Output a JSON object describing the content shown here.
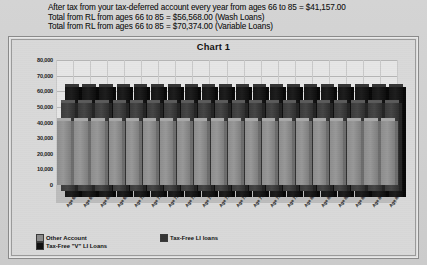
{
  "notes": [
    "After tax from your tax-deferred account every year from ages 66 to 85 = $41,157.00",
    "Total from RL from ages 66 to 85 = $56,568.00 (Wash Loans)",
    "Total from RL from ages 66 to 85 = $70,374.00 (Variable Loans)"
  ],
  "chart": {
    "title": "Chart 1"
  },
  "legend": {
    "items": [
      {
        "label": "Other Account",
        "color": "#8b8b8b"
      },
      {
        "label": "Tax-Free LI loans",
        "color": "#343434"
      },
      {
        "label": "Tax-Free \"V\" LI Loans",
        "color": "#101010"
      }
    ]
  },
  "chart_data": {
    "type": "bar",
    "title": "Chart 1",
    "xlabel": "",
    "ylabel": "",
    "ylim": [
      0,
      80000
    ],
    "yticks": [
      0,
      10000,
      20000,
      30000,
      40000,
      50000,
      60000,
      70000,
      80000
    ],
    "ytick_labels": [
      "0",
      "10,000",
      "20,000",
      "30,000",
      "40,000",
      "50,000",
      "60,000",
      "70,000",
      "80,000"
    ],
    "grid": true,
    "legend_position": "bottom-left",
    "three_d": true,
    "categories": [
      "Age 66",
      "Age 67",
      "Age 68",
      "Age 69",
      "Age 70",
      "Age 71",
      "Age 72",
      "Age 73",
      "Age 74",
      "Age 75",
      "Age 76",
      "Age 77",
      "Age 78",
      "Age 79",
      "Age 80",
      "Age 81",
      "Age 82",
      "Age 83",
      "Age 84",
      "Age 85"
    ],
    "series": [
      {
        "name": "Other Account",
        "color": "#8b8b8b",
        "values": [
          41157,
          41157,
          41157,
          41157,
          41157,
          41157,
          41157,
          41157,
          41157,
          41157,
          41157,
          41157,
          41157,
          41157,
          41157,
          41157,
          41157,
          41157,
          41157,
          41157
        ]
      },
      {
        "name": "Tax-Free LI loans",
        "color": "#343434",
        "values": [
          56568,
          56568,
          56568,
          56568,
          56568,
          56568,
          56568,
          56568,
          56568,
          56568,
          56568,
          56568,
          56568,
          56568,
          56568,
          56568,
          56568,
          56568,
          56568,
          56568
        ]
      },
      {
        "name": "Tax-Free \"V\" LI Loans",
        "color": "#101010",
        "values": [
          70374,
          70374,
          70374,
          70374,
          70374,
          70374,
          70374,
          70374,
          70374,
          70374,
          70374,
          70374,
          70374,
          70374,
          70374,
          70374,
          70374,
          70374,
          70374,
          70374
        ]
      }
    ]
  }
}
